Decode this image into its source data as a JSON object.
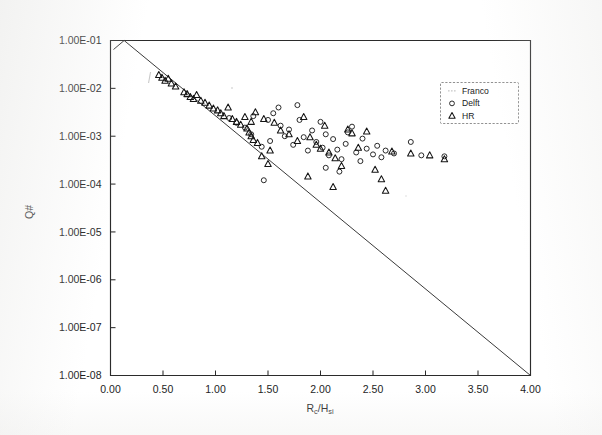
{
  "chart_data": {
    "type": "scatter",
    "title": "",
    "xlabel": "Rc/Hsi",
    "xlabel_parts": {
      "lead": "R",
      "sub1": "c",
      "mid": "/H",
      "sub2": "si"
    },
    "ylabel": "Q#",
    "xlim": [
      0.0,
      4.0
    ],
    "ylim_exponents": [
      -8,
      -1
    ],
    "grid": false,
    "xticks": [
      "0.00",
      "0.50",
      "1.00",
      "1.50",
      "2.00",
      "2.50",
      "3.00",
      "3.50",
      "4.00"
    ],
    "xtick_values": [
      0.0,
      0.5,
      1.0,
      1.5,
      2.0,
      2.5,
      3.0,
      3.5,
      4.0
    ],
    "yticks": [
      "1.00E-01",
      "1.00E-02",
      "1.00E-03",
      "1.00E-04",
      "1.00E-05",
      "1.00E-06",
      "1.00E-07",
      "1.00E-08"
    ],
    "ytick_exponents": [
      -1,
      -2,
      -3,
      -4,
      -5,
      -6,
      -7,
      -8
    ],
    "legend_position": "upper-right",
    "legend": [
      {
        "name": "Franco",
        "marker": "line"
      },
      {
        "name": "Delft",
        "marker": "circle"
      },
      {
        "name": "HR",
        "marker": "triangle"
      }
    ],
    "series": [
      {
        "name": "Franco",
        "marker": "line",
        "type": "line",
        "points": [
          [
            0.13,
            -1.0
          ],
          [
            4.0,
            -8.0
          ]
        ]
      },
      {
        "name": "Delft",
        "marker": "circle",
        "type": "scatter",
        "points": [
          [
            1.13,
            -2.62
          ],
          [
            1.2,
            -2.72
          ],
          [
            1.28,
            -2.82
          ],
          [
            1.36,
            -2.58
          ],
          [
            1.44,
            -3.22
          ],
          [
            1.52,
            -3.1
          ],
          [
            1.55,
            -2.52
          ],
          [
            1.6,
            -2.4
          ],
          [
            1.62,
            -2.78
          ],
          [
            1.66,
            -3.0
          ],
          [
            1.7,
            -2.86
          ],
          [
            1.74,
            -3.18
          ],
          [
            1.78,
            -2.35
          ],
          [
            1.8,
            -2.66
          ],
          [
            1.84,
            -3.02
          ],
          [
            1.88,
            -3.3
          ],
          [
            1.92,
            -2.88
          ],
          [
            1.96,
            -3.12
          ],
          [
            2.0,
            -2.7
          ],
          [
            2.02,
            -3.24
          ],
          [
            2.05,
            -2.96
          ],
          [
            2.08,
            -3.4
          ],
          [
            2.12,
            -3.06
          ],
          [
            2.16,
            -3.28
          ],
          [
            2.2,
            -3.48
          ],
          [
            2.24,
            -3.16
          ],
          [
            2.26,
            -2.92
          ],
          [
            2.3,
            -2.8
          ],
          [
            2.34,
            -3.34
          ],
          [
            2.38,
            -3.52
          ],
          [
            2.4,
            -3.05
          ],
          [
            2.44,
            -3.26
          ],
          [
            2.5,
            -3.38
          ],
          [
            2.54,
            -3.2
          ],
          [
            2.58,
            -3.44
          ],
          [
            2.62,
            -3.3
          ],
          [
            2.7,
            -3.36
          ],
          [
            2.86,
            -3.12
          ],
          [
            2.96,
            -3.4
          ],
          [
            3.18,
            -3.42
          ],
          [
            1.46,
            -3.92
          ],
          [
            2.05,
            -3.66
          ],
          [
            2.18,
            -3.74
          ],
          [
            1.34,
            -2.96
          ],
          [
            1.5,
            -2.66
          ]
        ]
      },
      {
        "name": "HR",
        "marker": "triangle",
        "type": "scatter",
        "points": [
          [
            0.46,
            -1.72
          ],
          [
            0.49,
            -1.78
          ],
          [
            0.52,
            -1.84
          ],
          [
            0.55,
            -1.8
          ],
          [
            0.58,
            -1.9
          ],
          [
            0.62,
            -1.96
          ],
          [
            0.7,
            -2.08
          ],
          [
            0.73,
            -2.12
          ],
          [
            0.76,
            -2.18
          ],
          [
            0.79,
            -2.22
          ],
          [
            0.82,
            -2.14
          ],
          [
            0.86,
            -2.26
          ],
          [
            0.9,
            -2.3
          ],
          [
            0.94,
            -2.36
          ],
          [
            0.98,
            -2.42
          ],
          [
            1.02,
            -2.46
          ],
          [
            1.05,
            -2.52
          ],
          [
            1.08,
            -2.58
          ],
          [
            1.12,
            -2.4
          ],
          [
            1.16,
            -2.64
          ],
          [
            1.2,
            -2.7
          ],
          [
            1.24,
            -2.76
          ],
          [
            1.28,
            -2.6
          ],
          [
            1.3,
            -2.84
          ],
          [
            1.32,
            -2.92
          ],
          [
            1.34,
            -3.0
          ],
          [
            1.34,
            -2.7
          ],
          [
            1.36,
            -3.08
          ],
          [
            1.38,
            -2.5
          ],
          [
            1.4,
            -3.14
          ],
          [
            1.44,
            -3.42
          ],
          [
            1.5,
            -3.58
          ],
          [
            1.56,
            -2.72
          ],
          [
            1.62,
            -2.88
          ],
          [
            1.7,
            -2.96
          ],
          [
            1.78,
            -3.1
          ],
          [
            1.84,
            -2.6
          ],
          [
            1.9,
            -3.02
          ],
          [
            1.96,
            -3.18
          ],
          [
            2.0,
            -3.26
          ],
          [
            2.04,
            -2.78
          ],
          [
            2.08,
            -3.34
          ],
          [
            2.14,
            -3.46
          ],
          [
            2.2,
            -3.62
          ],
          [
            2.26,
            -2.86
          ],
          [
            2.3,
            -2.94
          ],
          [
            2.36,
            -3.24
          ],
          [
            2.44,
            -2.9
          ],
          [
            2.52,
            -3.7
          ],
          [
            2.58,
            -3.9
          ],
          [
            2.62,
            -4.14
          ],
          [
            2.68,
            -3.32
          ],
          [
            2.86,
            -3.36
          ],
          [
            3.04,
            -3.4
          ],
          [
            3.18,
            -3.48
          ],
          [
            1.46,
            -2.64
          ],
          [
            1.52,
            -3.3
          ],
          [
            2.12,
            -4.06
          ],
          [
            1.88,
            -3.84
          ]
        ]
      }
    ]
  }
}
